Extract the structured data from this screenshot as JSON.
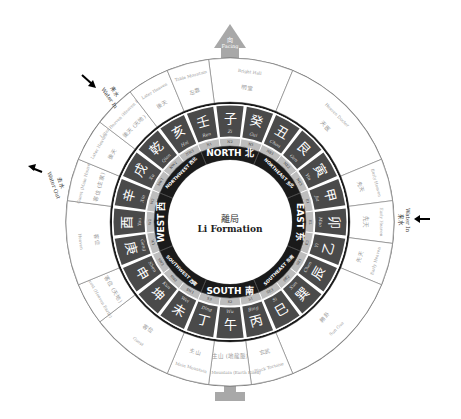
{
  "center": {
    "chinese": "離局",
    "english": "Li Formation"
  },
  "facing_marker": {
    "label_top": "向",
    "label": "Facing"
  },
  "sitting_marker": {
    "label": ""
  },
  "arrows": [
    {
      "id": "water-in-east",
      "chinese": "来水",
      "label": "Water In"
    },
    {
      "id": "water-in-northwest",
      "chinese": "来水",
      "label": "Water In"
    },
    {
      "id": "water-out-west",
      "chinese": "去水",
      "label": "Water Out"
    }
  ],
  "directions": [
    {
      "name": "NORTH",
      "chinese": "北",
      "angle": 0
    },
    {
      "name": "NORTHEAST",
      "chinese": "东北",
      "angle": 45
    },
    {
      "name": "EAST",
      "chinese": "东",
      "angle": 90
    },
    {
      "name": "SOUTHEAST",
      "chinese": "东南",
      "angle": 135
    },
    {
      "name": "SOUTH",
      "chinese": "南",
      "angle": 180
    },
    {
      "name": "SOUTHWEST",
      "chinese": "西南",
      "angle": 225
    },
    {
      "name": "WEST",
      "chinese": "西",
      "angle": 270
    },
    {
      "name": "NORTHWEST",
      "chinese": "西北",
      "angle": 315
    }
  ],
  "mountains": [
    {
      "chinese": "子",
      "pinyin": "Zi",
      "code": "N2"
    },
    {
      "chinese": "癸",
      "pinyin": "Gui",
      "code": "N3"
    },
    {
      "chinese": "丑",
      "pinyin": "Chou",
      "code": "NE1"
    },
    {
      "chinese": "艮",
      "pinyin": "Gen",
      "code": "NE2"
    },
    {
      "chinese": "寅",
      "pinyin": "Yin",
      "code": "NE3"
    },
    {
      "chinese": "甲",
      "pinyin": "Jia",
      "code": "E1"
    },
    {
      "chinese": "卯",
      "pinyin": "Mao",
      "code": "E2"
    },
    {
      "chinese": "乙",
      "pinyin": "Yi",
      "code": "E3"
    },
    {
      "chinese": "辰",
      "pinyin": "Chen",
      "code": "SE1"
    },
    {
      "chinese": "巽",
      "pinyin": "Xun",
      "code": "SE2"
    },
    {
      "chinese": "巳",
      "pinyin": "Si",
      "code": "SE3"
    },
    {
      "chinese": "丙",
      "pinyin": "Bing",
      "code": "S1"
    },
    {
      "chinese": "午",
      "pinyin": "Wu",
      "code": "S2"
    },
    {
      "chinese": "丁",
      "pinyin": "Ding",
      "code": "S3"
    },
    {
      "chinese": "未",
      "pinyin": "Wei",
      "code": "SW1"
    },
    {
      "chinese": "坤",
      "pinyin": "Kun",
      "code": "SW2"
    },
    {
      "chinese": "申",
      "pinyin": "Shen",
      "code": "SW3"
    },
    {
      "chinese": "庚",
      "pinyin": "Geng",
      "code": "W1"
    },
    {
      "chinese": "酉",
      "pinyin": "You",
      "code": "W2"
    },
    {
      "chinese": "辛",
      "pinyin": "Xin",
      "code": "W3"
    },
    {
      "chinese": "戌",
      "pinyin": "Xu",
      "code": "NW1"
    },
    {
      "chinese": "乾",
      "pinyin": "Qian",
      "code": "NW2"
    },
    {
      "chinese": "亥",
      "pinyin": "Hai",
      "code": "NW3"
    },
    {
      "chinese": "壬",
      "pinyin": "Ren",
      "code": "N1"
    }
  ],
  "outer_sectors": [
    {
      "start": 352.5,
      "end": 22.5,
      "chinese": "明堂",
      "english": "Bright Hall"
    },
    {
      "start": 22.5,
      "end": 67.5,
      "chinese": "天医",
      "english": "Heaven Doctor"
    },
    {
      "start": 67.5,
      "end": 82.5,
      "chinese": "先天",
      "english": "Early Heaven"
    },
    {
      "start": 82.5,
      "end": 97.5,
      "chinese": "先天",
      "english": "Early Heaven"
    },
    {
      "start": 97.5,
      "end": 112.5,
      "chinese": "先天",
      "english": "Early Heaven"
    },
    {
      "start": 112.5,
      "end": 157.5,
      "chinese": "賴卦",
      "english": "Sun Gua"
    },
    {
      "start": 157.5,
      "end": 172.5,
      "chinese": "玄武",
      "english": "Black Tortoise"
    },
    {
      "start": 172.5,
      "end": 187.5,
      "chinese": "主山 (地龍脈)",
      "english": "Main Mountain (Earth Kilon)"
    },
    {
      "start": 187.5,
      "end": 202.5,
      "chinese": "主山",
      "english": "Main Mountain"
    },
    {
      "start": 202.5,
      "end": 232.5,
      "chinese": "客位",
      "english": "Guest"
    },
    {
      "start": 232.5,
      "end": 247.5,
      "chinese": "客位 (天地)",
      "english": "Guest (Heaven Earth)"
    },
    {
      "start": 247.5,
      "end": 277.5,
      "chinese": "客位",
      "english": "Heaven"
    },
    {
      "start": 277.5,
      "end": 292.5,
      "chinese": "客位 (主家)",
      "english": "Guest (Main House)"
    },
    {
      "start": 292.5,
      "end": 307.5,
      "chinese": "後天",
      "english": "Later Heaven"
    },
    {
      "start": 307.5,
      "end": 322.5,
      "chinese": "後天 (天地)",
      "english": "Later Heaven (Heaven Earth)"
    },
    {
      "start": 322.5,
      "end": 337.5,
      "chinese": "後天",
      "english": "Later Heaven"
    },
    {
      "start": 337.5,
      "end": 352.5,
      "chinese": "左靠",
      "english": "Table Mountain"
    }
  ],
  "colors": {
    "ring_dark": "#1a1a1a",
    "mountain_fill": "#4a4a4a",
    "mountain_border": "#ffffff",
    "code_fill": "#bdbdbd",
    "outer_line": "#777777",
    "outer_text": "#9a9a9a",
    "marker": "#a8a8a8"
  }
}
